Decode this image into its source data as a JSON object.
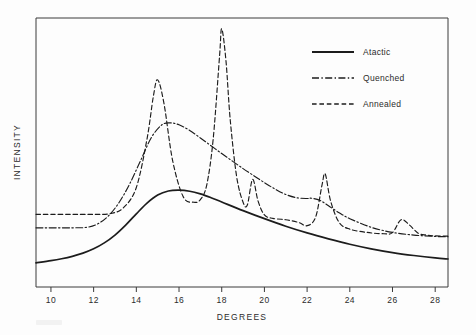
{
  "figure": {
    "background_color": "#fdfdfd",
    "line_color": "#1c1c1c",
    "axis_color": "#3a3a3a"
  },
  "axes": {
    "x_title": "DEGREES",
    "y_title": "INTENSITY",
    "x_ticks": [
      "10",
      "12",
      "14",
      "16",
      "18",
      "20",
      "22",
      "24",
      "26",
      "28"
    ]
  },
  "legend": {
    "position": "top-right",
    "entries": [
      {
        "label": "Atactic",
        "style": "solid"
      },
      {
        "label": "Quenched",
        "style": "dash-dot"
      },
      {
        "label": "Annealed",
        "style": "dashed"
      }
    ]
  },
  "chart_data": {
    "type": "line",
    "title": "",
    "subtitle": "",
    "xlabel": "DEGREES",
    "ylabel": "INTENSITY",
    "xlim": [
      9.3,
      28.6
    ],
    "ylim": [
      0,
      100
    ],
    "grid": false,
    "legend_position": "top-right",
    "annotations": [],
    "x_tick_values": [
      10,
      12,
      14,
      16,
      18,
      20,
      22,
      24,
      26,
      28
    ],
    "y_tick_values": [],
    "series": [
      {
        "name": "Atactic",
        "style": "solid",
        "peaks": [
          {
            "x": 16.0,
            "y": 36.0,
            "type": "broad amorphous halo"
          }
        ],
        "x": [
          9.3,
          10.0,
          10.5,
          11.0,
          11.5,
          12.0,
          12.5,
          13.0,
          13.5,
          14.0,
          14.5,
          15.0,
          15.5,
          16.0,
          16.5,
          17.0,
          17.5,
          18.0,
          19.0,
          20.0,
          21.0,
          22.0,
          23.0,
          24.0,
          25.0,
          26.0,
          27.0,
          28.0,
          28.6
        ],
        "y": [
          9.0,
          9.8,
          10.5,
          11.4,
          12.6,
          14.2,
          16.4,
          19.3,
          23.0,
          27.2,
          31.2,
          34.2,
          35.7,
          36.0,
          35.6,
          34.6,
          33.2,
          31.6,
          28.4,
          25.4,
          22.6,
          20.1,
          17.9,
          15.9,
          14.2,
          12.8,
          11.7,
          10.8,
          10.4
        ]
      },
      {
        "name": "Quenched",
        "style": "dash-dot",
        "peaks": [
          {
            "x": 15.6,
            "y": 61.0,
            "type": "broad smectic peak"
          },
          {
            "x": 22.2,
            "y": 33.0,
            "type": "broad smectic peak"
          }
        ],
        "x": [
          9.3,
          10.0,
          11.0,
          11.7,
          12.2,
          12.7,
          13.2,
          13.7,
          14.2,
          14.7,
          15.2,
          15.6,
          16.0,
          16.5,
          17.0,
          17.5,
          18.0,
          18.5,
          19.0,
          19.5,
          20.0,
          20.5,
          21.0,
          21.5,
          22.0,
          22.2,
          22.6,
          23.0,
          23.5,
          24.0,
          25.0,
          26.0,
          27.0,
          28.0,
          28.6
        ],
        "y": [
          22.0,
          22.0,
          22.0,
          22.2,
          23.5,
          26.5,
          31.5,
          38.5,
          47.0,
          55.5,
          60.3,
          61.0,
          60.3,
          58.2,
          55.4,
          52.5,
          49.6,
          46.8,
          44.0,
          41.4,
          38.8,
          36.4,
          34.4,
          33.2,
          32.9,
          33.0,
          32.2,
          30.2,
          27.6,
          25.4,
          22.2,
          20.3,
          19.3,
          18.8,
          18.7
        ]
      },
      {
        "name": "Annealed",
        "style": "dashed",
        "peaks": [
          {
            "x": 15.0,
            "y": 77.0,
            "hkl": "110"
          },
          {
            "x": 18.0,
            "y": 96.0,
            "hkl": "040"
          },
          {
            "x": 19.5,
            "y": 40.0,
            "hkl": "130"
          },
          {
            "x": 22.8,
            "y": 42.0,
            "hkl": "131/041"
          },
          {
            "x": 26.4,
            "y": 25.0,
            "hkl": "060"
          }
        ],
        "x": [
          9.3,
          10.0,
          11.0,
          12.0,
          12.8,
          13.4,
          14.0,
          14.5,
          14.8,
          15.0,
          15.3,
          15.7,
          16.2,
          16.7,
          17.0,
          17.3,
          17.6,
          17.9,
          18.0,
          18.2,
          18.4,
          18.7,
          19.0,
          19.2,
          19.45,
          19.7,
          20.0,
          20.4,
          21.0,
          21.6,
          22.0,
          22.4,
          22.7,
          22.85,
          23.1,
          23.5,
          24.0,
          24.8,
          25.6,
          26.0,
          26.4,
          26.8,
          27.2,
          27.6,
          28.0,
          28.6
        ],
        "y": [
          27.0,
          27.0,
          27.0,
          27.0,
          27.3,
          29.5,
          37.0,
          55.0,
          71.0,
          77.0,
          68.0,
          47.0,
          33.5,
          31.5,
          32.5,
          38.0,
          55.0,
          86.0,
          96.0,
          84.0,
          62.0,
          41.0,
          31.5,
          30.5,
          40.0,
          32.0,
          26.8,
          25.5,
          25.0,
          24.0,
          22.8,
          26.0,
          38.0,
          42.0,
          32.0,
          24.0,
          21.5,
          20.3,
          19.8,
          20.2,
          25.0,
          23.0,
          20.0,
          19.3,
          19.0,
          18.9
        ]
      }
    ]
  }
}
